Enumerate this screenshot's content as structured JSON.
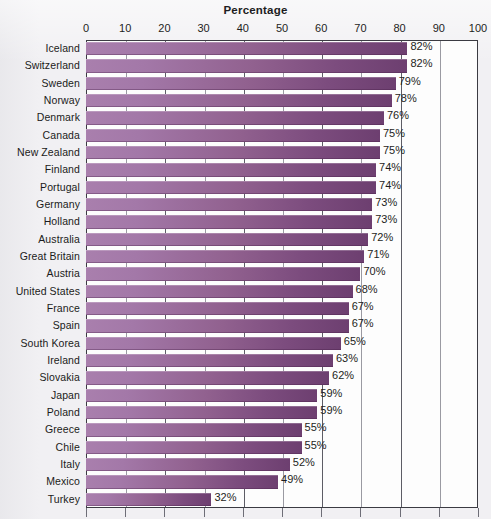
{
  "chart_data": {
    "type": "bar",
    "orientation": "horizontal",
    "title": "Percentage",
    "xlabel": "",
    "ylabel": "",
    "xlim": [
      0,
      100
    ],
    "xticks": [
      0,
      10,
      20,
      30,
      40,
      50,
      60,
      70,
      80,
      90,
      100
    ],
    "xtick_labels": [
      "0",
      "10",
      "20",
      "30",
      "40",
      "50",
      "60",
      "70",
      "80",
      "90",
      "100"
    ],
    "grid": true,
    "grid_axis": "x",
    "legend": false,
    "bar_color": "#8e5d8f",
    "bar_gradient": [
      "#a97fad",
      "#6d3f70"
    ],
    "value_suffix": "%",
    "categories": [
      "Iceland",
      "Switzerland",
      "Sweden",
      "Norway",
      "Denmark",
      "Canada",
      "New Zealand",
      "Finland",
      "Portugal",
      "Germany",
      "Holland",
      "Australia",
      "Great Britain",
      "Austria",
      "United States",
      "France",
      "Spain",
      "South Korea",
      "Ireland",
      "Slovakia",
      "Japan",
      "Poland",
      "Greece",
      "Chile",
      "Italy",
      "Mexico",
      "Turkey"
    ],
    "values": [
      82,
      82,
      79,
      78,
      76,
      75,
      75,
      74,
      74,
      73,
      73,
      72,
      71,
      70,
      68,
      67,
      67,
      65,
      63,
      62,
      59,
      59,
      55,
      55,
      52,
      49,
      32
    ],
    "value_labels": [
      "82%",
      "82%",
      "79%",
      "78%",
      "76%",
      "75%",
      "75%",
      "74%",
      "74%",
      "73%",
      "73%",
      "72%",
      "71%",
      "70%",
      "68%",
      "67%",
      "67%",
      "65%",
      "63%",
      "62%",
      "59%",
      "59%",
      "55%",
      "55%",
      "52%",
      "49%",
      "32%"
    ]
  }
}
